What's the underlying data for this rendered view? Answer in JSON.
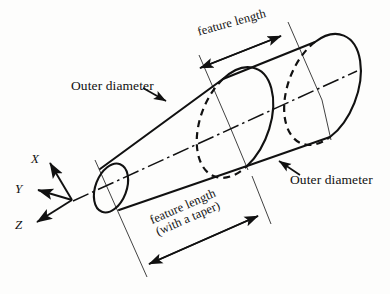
{
  "figure": {
    "background_color": "#fdfdfc",
    "line_color": "#111111"
  },
  "axes": {
    "origin_label": "",
    "items": [
      {
        "label": "X",
        "direction": "up-left"
      },
      {
        "label": "Y",
        "direction": "left"
      },
      {
        "label": "Z",
        "direction": "down-left"
      }
    ]
  },
  "callouts": [
    {
      "id": "outer-diameter-top",
      "text": "Outer diameter"
    },
    {
      "id": "outer-diameter-bottom",
      "text": "Outer diameter"
    }
  ],
  "dimensions": [
    {
      "id": "feature-length-top",
      "text": "feature length"
    },
    {
      "id": "feature-length-taper",
      "line1": "feature length",
      "line2": "(with a taper)"
    }
  ]
}
